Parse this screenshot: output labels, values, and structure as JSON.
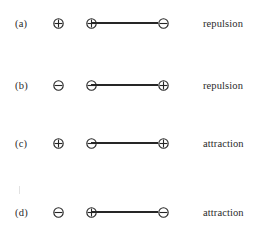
{
  "diagram": {
    "symbols": {
      "positive": "positive-charge-icon",
      "negative": "negative-charge-icon"
    },
    "rows": [
      {
        "label": "(a)",
        "single_charge": "positive",
        "pair_left_charge": "positive",
        "pair_right_charge": "negative",
        "outcome": "repulsion",
        "top": 10
      },
      {
        "label": "(b)",
        "single_charge": "negative",
        "pair_left_charge": "negative",
        "pair_right_charge": "positive",
        "outcome": "repulsion",
        "top": 72
      },
      {
        "label": "(c)",
        "single_charge": "positive",
        "pair_left_charge": "negative",
        "pair_right_charge": "positive",
        "outcome": "attraction",
        "top": 130
      },
      {
        "label": "(d)",
        "single_charge": "negative",
        "pair_left_charge": "positive",
        "pair_right_charge": "negative",
        "outcome": "attraction",
        "top": 199
      }
    ]
  },
  "colors": {
    "ink": "#262626",
    "text": "#2a2a2a",
    "background": "#ffffff"
  }
}
